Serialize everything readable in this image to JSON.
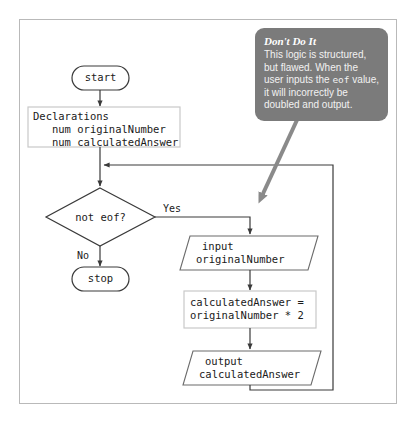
{
  "diagram": {
    "frame": {
      "border_color": "#b9b9b9"
    }
  },
  "callout": {
    "title": "Don't Do It",
    "body_part1": "This logic is structured, but flawed. When the user inputs the ",
    "body_code": "eof",
    "body_part2": " value, it will incorrectly be doubled and output.",
    "background_color": "#7b7b7b",
    "text_color": "#ffffff",
    "arrow_color": "#8a8a8a"
  },
  "nodes": {
    "start": {
      "label": "start",
      "shape": "terminator"
    },
    "declarations": {
      "line1": "Declarations",
      "line2": "   num originalNumber",
      "line3": "   num calculatedAnswer",
      "shape": "process",
      "border_color": "#c9c9c9"
    },
    "decision": {
      "label": "not eof?",
      "shape": "diamond"
    },
    "stop": {
      "label": "stop",
      "shape": "terminator"
    },
    "input": {
      "line1": "input",
      "line2": "originalNumber",
      "shape": "parallelogram"
    },
    "calculate": {
      "line1": "calculatedAnswer =",
      "line2": "originalNumber * 2",
      "shape": "process",
      "border_color": "#c9c9c9"
    },
    "output": {
      "line1": "output",
      "line2": "calculatedAnswer",
      "shape": "parallelogram"
    }
  },
  "edges": {
    "yes_label": "Yes",
    "no_label": "No",
    "line_color": "#3a3a3a"
  }
}
